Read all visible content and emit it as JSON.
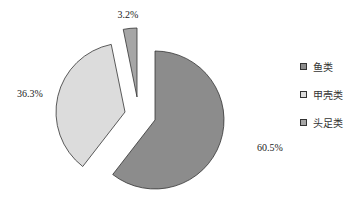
{
  "chart_data": {
    "type": "pie",
    "title": "",
    "slices": [
      {
        "label": "鱼类",
        "value": 60.5,
        "display": "60.5%",
        "color": "#8c8c8c"
      },
      {
        "label": "甲壳类",
        "value": 36.3,
        "display": "36.3%",
        "color": "#dcdcdc"
      },
      {
        "label": "头足类",
        "value": 3.2,
        "display": "3.2%",
        "color": "#a6a6a6"
      }
    ],
    "exploded": true,
    "legend_position": "right"
  },
  "legend": {
    "items": [
      {
        "label": "鱼类",
        "color": "#8c8c8c"
      },
      {
        "label": "甲壳类",
        "color": "#dcdcdc"
      },
      {
        "label": "头足类",
        "color": "#a6a6a6"
      }
    ]
  }
}
